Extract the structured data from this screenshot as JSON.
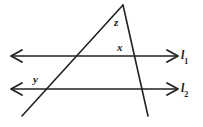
{
  "figure": {
    "background_color": "#ffffff",
    "stroke_color": "#222222",
    "labels": {
      "angle_z": "z",
      "angle_x": "x",
      "angle_y": "y",
      "line_1_base": "l",
      "line_1_sub": "1",
      "line_2_base": "l",
      "line_2_sub": "2"
    },
    "geometry": {
      "parallel_line_1": {
        "y": 56,
        "x_start": 12,
        "x_end": 177
      },
      "parallel_line_2": {
        "y": 89,
        "x_start": 12,
        "x_end": 177
      },
      "transversal_left": {
        "x1": 123,
        "y1": 5,
        "x2": 22,
        "y2": 116
      },
      "transversal_right": {
        "x1": 123,
        "y1": 5,
        "x2": 148,
        "y2": 116
      },
      "apex": {
        "x": 123,
        "y": 5
      },
      "intersections": [
        {
          "name": "left-transversal-line1",
          "x": 72,
          "y": 56
        },
        {
          "name": "right-transversal-line1",
          "x": 133,
          "y": 56
        },
        {
          "name": "left-transversal-line2",
          "x": 42,
          "y": 89
        },
        {
          "name": "right-transversal-line2",
          "x": 143,
          "y": 89
        }
      ],
      "arrow_heads": [
        {
          "name": "line1-left-arrow",
          "x": 12,
          "y": 56,
          "direction": "left"
        },
        {
          "name": "line1-right-arrow",
          "x": 177,
          "y": 56,
          "direction": "right"
        },
        {
          "name": "line2-left-arrow",
          "x": 12,
          "y": 89,
          "direction": "left"
        },
        {
          "name": "line2-right-arrow",
          "x": 177,
          "y": 89,
          "direction": "right"
        }
      ]
    }
  }
}
